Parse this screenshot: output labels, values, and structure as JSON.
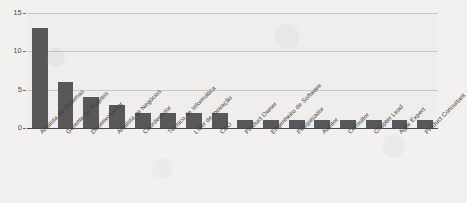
{
  "chart_data": {
    "type": "bar",
    "title": "",
    "xlabel": "",
    "ylabel": "",
    "ylim": [
      0,
      15
    ],
    "yticks": [
      0,
      5,
      10,
      15
    ],
    "grid": true,
    "legend": "none",
    "bar_color": "#58585a",
    "background_color": "#efeeec",
    "gridline_color": "#c9c8c5",
    "categories": [
      "Analista de Sistemas",
      "Gerente de Projetos",
      "Desenvolvedor",
      "Analista de Negócios",
      "Coordenador",
      "Técnico de Informática",
      "Líder de Inovação",
      "CEO",
      "Product Owner",
      "Engenheiro de Software",
      "Pesquisador",
      "Auditor",
      "Consultor",
      "Chapter Lead",
      "Agile Expert",
      "Product Consultant"
    ],
    "values": [
      13,
      6,
      4,
      3,
      2,
      2,
      2,
      2,
      1,
      1,
      1,
      1,
      1,
      1,
      1,
      1
    ]
  },
  "axis": {
    "tick_labels": [
      "15",
      "10",
      "5",
      "0"
    ]
  }
}
